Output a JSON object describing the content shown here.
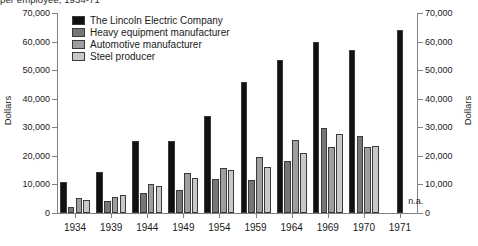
{
  "chart_data": {
    "type": "bar",
    "title": "per employee, 1934-71",
    "xlabel": "",
    "ylabel": "Dollars",
    "ylabel_right": "Dollars",
    "ylim": [
      0,
      70000
    ],
    "ytick_step": 10000,
    "grid": false,
    "legend_position": "top-center",
    "categories": [
      "1934",
      "1939",
      "1944",
      "1949",
      "1954",
      "1959",
      "1964",
      "1969",
      "1970",
      "1971"
    ],
    "yticks": [
      "0",
      "10,000",
      "20,000",
      "30,000",
      "40,000",
      "50,000",
      "60,000",
      "70,000"
    ],
    "series": [
      {
        "name": "The Lincoln Electric Company",
        "color": "#111111",
        "values": [
          11000,
          14500,
          25200,
          25200,
          34000,
          46000,
          53500,
          60000,
          57000,
          64000
        ]
      },
      {
        "name": "Heavy equipment manufacturer",
        "color": "#767676",
        "values": [
          2200,
          4300,
          7000,
          8000,
          11800,
          11500,
          18300,
          29800,
          26800,
          null
        ]
      },
      {
        "name": "Automotive manufacturer",
        "color": "#9e9e9e",
        "values": [
          5100,
          5600,
          10200,
          13900,
          15900,
          19500,
          25500,
          23200,
          23200,
          null
        ]
      },
      {
        "name": "Steel producer",
        "color": "#c9c9c9",
        "values": [
          4600,
          6200,
          9400,
          12200,
          15000,
          16000,
          21000,
          27500,
          23500,
          null
        ]
      }
    ],
    "annotations": [
      {
        "text": "n.a.",
        "category": "1971",
        "note": "no data available for comparison firms in 1971"
      }
    ]
  },
  "legend": {
    "items": [
      {
        "label": "The Lincoln Electric Company",
        "color": "#111111"
      },
      {
        "label": "Heavy equipment manufacturer",
        "color": "#767676"
      },
      {
        "label": "Automotive manufacturer",
        "color": "#9e9e9e"
      },
      {
        "label": "Steel producer",
        "color": "#c9c9c9"
      }
    ]
  }
}
